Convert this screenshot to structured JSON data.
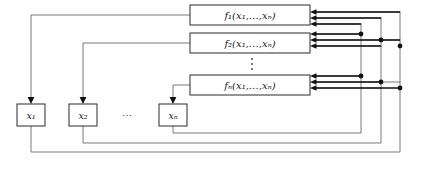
{
  "figure": {
    "background_color": "#fefefe",
    "line_color_feedback": "#6e6e6e",
    "line_color_input": "#111111",
    "box_stroke": "#2b2b2b"
  },
  "function_boxes": [
    {
      "id": "f1",
      "label": "f₁(x₁,…,xₙ)",
      "x": 190,
      "y": 5,
      "width": 120,
      "height": 20
    },
    {
      "id": "f2",
      "label": "f₂(x₁,…,xₙ)",
      "x": 190,
      "y": 33,
      "width": 120,
      "height": 20
    },
    {
      "id": "fn",
      "label": "fₙ(x₁,…,xₙ)",
      "x": 190,
      "y": 75,
      "width": 120,
      "height": 20
    }
  ],
  "vertical_ellipsis": {
    "symbol": "⋮",
    "x": 252,
    "y_top": 58,
    "y_bottom": 70,
    "dots": 3
  },
  "variable_boxes": [
    {
      "id": "x1",
      "label": "x₁",
      "x": 17,
      "y": 104,
      "width": 28,
      "height": 22
    },
    {
      "id": "x2",
      "label": "x₂",
      "x": 69,
      "y": 104,
      "width": 28,
      "height": 22
    },
    {
      "id": "xn",
      "label": "xₙ",
      "x": 159,
      "y": 104,
      "width": 28,
      "height": 22
    }
  ],
  "horizontal_ellipsis": {
    "symbol": "⋯",
    "x": 127,
    "y": 115
  },
  "output_paths": [
    {
      "from": "f1",
      "to": "x1",
      "corner_y": 15,
      "drop_x": 31
    },
    {
      "from": "f2",
      "to": "x2",
      "corner_y": 43,
      "drop_x": 83
    },
    {
      "from": "fn",
      "to": "xn",
      "corner_y": 85,
      "drop_x": 173
    }
  ],
  "feedback_buses": [
    {
      "source": "x1",
      "bus_x": 400,
      "return_y": 152,
      "taps": [
        12,
        40,
        82
      ]
    },
    {
      "source": "x2",
      "bus_x": 381,
      "return_y": 143,
      "taps": [
        18,
        46,
        88
      ]
    },
    {
      "source": "xn",
      "bus_x": 361,
      "return_y": 133,
      "taps": [
        24,
        34,
        76
      ]
    }
  ],
  "input_arrow_rows": {
    "f1": [
      11,
      17,
      23
    ],
    "f2": [
      39,
      45,
      51
    ],
    "fn": [
      81,
      87,
      93
    ]
  },
  "legend": {
    "description": "Each function block f_i receives all state variables x_1..x_n as inputs and writes its result back into state variable x_i."
  }
}
